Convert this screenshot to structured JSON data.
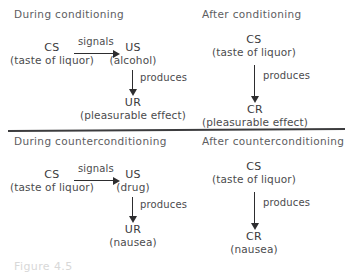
{
  "figure": {
    "caption": "Figure 4.5",
    "divider_color": "#3c3c3e",
    "text_color": "#4b4b4d",
    "code_color": "#3a3a3c",
    "arrow_color": "#2d2d2f"
  },
  "panels": {
    "top_left": {
      "title": "During conditioning",
      "cs": {
        "code": "CS",
        "gloss": "(taste of liquor)"
      },
      "us": {
        "code": "US",
        "gloss": "(alcohol)"
      },
      "ur": {
        "code": "UR",
        "gloss": "(pleasurable effect)"
      },
      "link_cs_us": "signals",
      "link_us_ur": "produces"
    },
    "top_right": {
      "title": "After conditioning",
      "cs": {
        "code": "CS",
        "gloss": "(taste of liquor)"
      },
      "cr": {
        "code": "CR",
        "gloss": "(pleasurable effect)"
      },
      "link_cs_cr": "produces"
    },
    "bottom_left": {
      "title": "During counterconditioning",
      "cs": {
        "code": "CS",
        "gloss": "(taste of liquor)"
      },
      "us": {
        "code": "US",
        "gloss": "(drug)"
      },
      "ur": {
        "code": "UR",
        "gloss": "(nausea)"
      },
      "link_cs_us": "signals",
      "link_us_ur": "produces"
    },
    "bottom_right": {
      "title": "After counterconditioning",
      "cs": {
        "code": "CS",
        "gloss": "(taste of liquor)"
      },
      "cr": {
        "code": "CR",
        "gloss": "(nausea)"
      },
      "link_cs_cr": "produces"
    }
  }
}
